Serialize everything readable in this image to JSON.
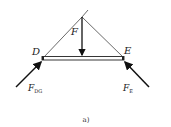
{
  "figure": {
    "caption": "a)",
    "labels": {
      "point_d": "D",
      "point_e": "E",
      "force_f": "F",
      "force_dg_main": "F",
      "force_dg_sub": "DG",
      "force_e_main": "F",
      "force_e_sub": "E"
    },
    "colors": {
      "line": "#333333",
      "arrow": "#111111"
    }
  }
}
